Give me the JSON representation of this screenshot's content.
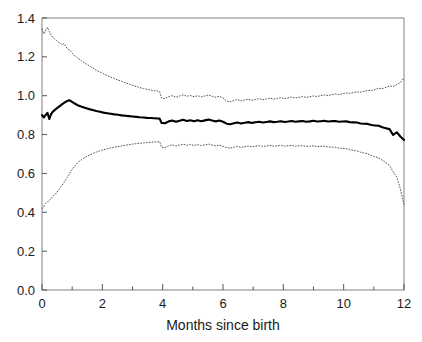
{
  "chart_data": {
    "type": "line",
    "title": "",
    "subtitle": "",
    "xlabel": "Months since birth",
    "ylabel": "",
    "xlim": [
      0,
      12
    ],
    "ylim": [
      0.0,
      1.4
    ],
    "xticks": [
      0,
      2,
      4,
      6,
      8,
      10,
      12
    ],
    "xticklabels": [
      "0",
      "2",
      "4",
      "6",
      "8",
      "10",
      "12"
    ],
    "x_minor_ticks": [
      1,
      3,
      5,
      7,
      9,
      11
    ],
    "yticks": [
      0.0,
      0.2,
      0.4,
      0.6,
      0.8,
      1.0,
      1.2,
      1.4
    ],
    "yticklabels": [
      "0.0",
      "0.2",
      "0.4",
      "0.6",
      "0.8",
      "1.0",
      "1.2",
      "1.4"
    ],
    "grid": false,
    "legend": null,
    "frame": "box",
    "colors": {
      "estimate": "#000000",
      "confidence_band": "#333333",
      "frame": "#8c8c8c"
    },
    "x": [
      0.0,
      0.06,
      0.12,
      0.18,
      0.24,
      0.3,
      0.36,
      0.42,
      0.48,
      0.54,
      0.6,
      0.66,
      0.72,
      0.78,
      0.84,
      0.9,
      0.96,
      1.02,
      1.08,
      1.14,
      1.2,
      1.32,
      1.44,
      1.56,
      1.68,
      1.8,
      1.92,
      2.04,
      2.16,
      2.28,
      2.4,
      2.52,
      2.64,
      2.76,
      2.88,
      3.0,
      3.12,
      3.24,
      3.36,
      3.48,
      3.6,
      3.72,
      3.84,
      3.9,
      3.96,
      4.08,
      4.2,
      4.32,
      4.44,
      4.56,
      4.68,
      4.8,
      4.92,
      5.04,
      5.16,
      5.28,
      5.4,
      5.52,
      5.64,
      5.76,
      5.88,
      6.0,
      6.12,
      6.24,
      6.36,
      6.48,
      6.6,
      6.72,
      6.84,
      6.96,
      7.08,
      7.2,
      7.32,
      7.44,
      7.56,
      7.68,
      7.8,
      7.92,
      8.04,
      8.16,
      8.28,
      8.4,
      8.52,
      8.64,
      8.76,
      8.88,
      9.0,
      9.12,
      9.24,
      9.36,
      9.48,
      9.6,
      9.72,
      9.84,
      9.96,
      10.08,
      10.2,
      10.32,
      10.44,
      10.56,
      10.68,
      10.8,
      10.92,
      11.04,
      11.16,
      11.28,
      11.4,
      11.52,
      11.64,
      11.76,
      11.88,
      12.0
    ],
    "series": [
      {
        "name": "upper confidence limit",
        "style": "dotted",
        "values": [
          1.345,
          1.318,
          1.336,
          1.352,
          1.33,
          1.312,
          1.3,
          1.292,
          1.285,
          1.276,
          1.272,
          1.262,
          1.268,
          1.255,
          1.242,
          1.236,
          1.228,
          1.215,
          1.205,
          1.2,
          1.192,
          1.178,
          1.166,
          1.154,
          1.143,
          1.131,
          1.122,
          1.113,
          1.104,
          1.096,
          1.088,
          1.081,
          1.074,
          1.067,
          1.06,
          1.054,
          1.048,
          1.042,
          1.037,
          1.033,
          1.029,
          1.026,
          1.024,
          1.021,
          0.988,
          0.985,
          0.996,
          1.0,
          0.992,
          0.998,
          1.004,
          0.997,
          1.001,
          0.995,
          1.0,
          0.994,
          0.999,
          1.004,
          0.997,
          0.992,
          0.997,
          0.989,
          0.972,
          0.968,
          0.975,
          0.98,
          0.973,
          0.978,
          0.982,
          0.976,
          0.981,
          0.985,
          0.979,
          0.983,
          0.988,
          0.982,
          0.986,
          0.99,
          0.985,
          0.989,
          0.993,
          0.988,
          0.992,
          0.996,
          0.991,
          0.995,
          0.999,
          0.996,
          1.0,
          1.004,
          1.001,
          1.005,
          1.009,
          1.006,
          1.01,
          1.014,
          1.012,
          1.016,
          1.02,
          1.018,
          1.023,
          1.028,
          1.026,
          1.032,
          1.038,
          1.036,
          1.043,
          1.05,
          1.048,
          1.057,
          1.068,
          1.092
        ]
      },
      {
        "name": "point estimate",
        "style": "solid-bold",
        "values": [
          0.9,
          0.888,
          0.901,
          0.912,
          0.88,
          0.905,
          0.918,
          0.926,
          0.934,
          0.941,
          0.948,
          0.955,
          0.962,
          0.968,
          0.973,
          0.977,
          0.972,
          0.966,
          0.96,
          0.955,
          0.95,
          0.943,
          0.937,
          0.931,
          0.926,
          0.921,
          0.917,
          0.913,
          0.91,
          0.907,
          0.904,
          0.902,
          0.899,
          0.897,
          0.895,
          0.893,
          0.891,
          0.889,
          0.888,
          0.886,
          0.885,
          0.884,
          0.883,
          0.882,
          0.86,
          0.858,
          0.868,
          0.872,
          0.866,
          0.871,
          0.876,
          0.87,
          0.874,
          0.869,
          0.874,
          0.869,
          0.873,
          0.877,
          0.872,
          0.868,
          0.872,
          0.866,
          0.856,
          0.853,
          0.858,
          0.862,
          0.857,
          0.861,
          0.864,
          0.86,
          0.863,
          0.866,
          0.862,
          0.865,
          0.868,
          0.864,
          0.866,
          0.869,
          0.865,
          0.867,
          0.87,
          0.866,
          0.868,
          0.87,
          0.866,
          0.868,
          0.871,
          0.867,
          0.869,
          0.871,
          0.867,
          0.869,
          0.87,
          0.866,
          0.867,
          0.868,
          0.864,
          0.863,
          0.862,
          0.857,
          0.856,
          0.855,
          0.849,
          0.847,
          0.845,
          0.838,
          0.833,
          0.828,
          0.798,
          0.812,
          0.79,
          0.772
        ]
      },
      {
        "name": "lower confidence limit",
        "style": "dotted",
        "values": [
          0.418,
          0.43,
          0.446,
          0.452,
          0.462,
          0.47,
          0.483,
          0.492,
          0.498,
          0.513,
          0.525,
          0.538,
          0.551,
          0.566,
          0.58,
          0.596,
          0.612,
          0.625,
          0.637,
          0.648,
          0.658,
          0.672,
          0.684,
          0.694,
          0.702,
          0.71,
          0.716,
          0.722,
          0.727,
          0.731,
          0.735,
          0.739,
          0.742,
          0.745,
          0.748,
          0.751,
          0.753,
          0.755,
          0.757,
          0.759,
          0.76,
          0.762,
          0.763,
          0.764,
          0.735,
          0.733,
          0.743,
          0.747,
          0.741,
          0.746,
          0.75,
          0.745,
          0.749,
          0.744,
          0.748,
          0.743,
          0.747,
          0.751,
          0.746,
          0.742,
          0.746,
          0.74,
          0.733,
          0.73,
          0.735,
          0.739,
          0.734,
          0.738,
          0.741,
          0.737,
          0.74,
          0.743,
          0.739,
          0.741,
          0.744,
          0.74,
          0.742,
          0.744,
          0.74,
          0.742,
          0.744,
          0.74,
          0.742,
          0.743,
          0.739,
          0.74,
          0.742,
          0.738,
          0.739,
          0.74,
          0.736,
          0.736,
          0.735,
          0.73,
          0.729,
          0.728,
          0.722,
          0.719,
          0.716,
          0.709,
          0.705,
          0.701,
          0.692,
          0.686,
          0.68,
          0.668,
          0.656,
          0.642,
          0.608,
          0.582,
          0.52,
          0.44
        ]
      }
    ]
  }
}
